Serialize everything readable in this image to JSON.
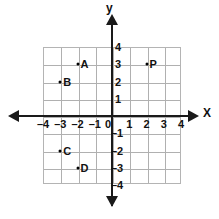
{
  "figure": {
    "type": "coordinate-plane",
    "axes": {
      "x_name": "X",
      "y_name": "y",
      "x_min": -4,
      "x_max": 4,
      "y_min": -4,
      "y_max": 4
    },
    "x_tick_labels": [
      {
        "text": "–4",
        "value": -4
      },
      {
        "text": "–3",
        "value": -3
      },
      {
        "text": "–2",
        "value": -2
      },
      {
        "text": "–1",
        "value": -1
      },
      {
        "text": "0",
        "value": 0
      },
      {
        "text": "1",
        "value": 1
      },
      {
        "text": "2",
        "value": 2
      },
      {
        "text": "3",
        "value": 3
      },
      {
        "text": "4",
        "value": 4
      }
    ],
    "y_tick_labels": [
      {
        "text": "4",
        "value": 4
      },
      {
        "text": "3",
        "value": 3
      },
      {
        "text": "2",
        "value": 2
      },
      {
        "text": "1",
        "value": 1
      },
      {
        "text": "–1",
        "value": -1
      },
      {
        "text": "–2",
        "value": -2
      },
      {
        "text": "–3",
        "value": -3
      },
      {
        "text": "–4",
        "value": -4
      }
    ],
    "points": [
      {
        "label": "A",
        "x": -2,
        "y": 3
      },
      {
        "label": "B",
        "x": -3,
        "y": 2
      },
      {
        "label": "P",
        "x": 2,
        "y": 3
      },
      {
        "label": "C",
        "x": -3,
        "y": -2
      },
      {
        "label": "D",
        "x": -2,
        "y": -3
      }
    ],
    "colors": {
      "grid": "#b0b0b0",
      "axis": "#1a1a1a",
      "text": "#111111",
      "point": "#000000",
      "background": "#ffffff"
    }
  }
}
